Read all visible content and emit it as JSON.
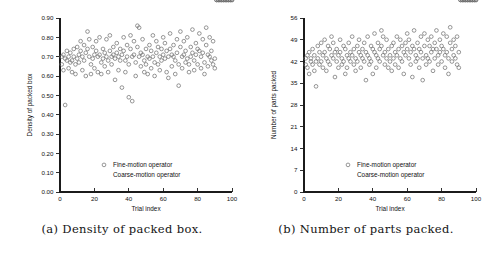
{
  "figure": {
    "background": "#ffffff",
    "marker_color": "#6e6e6e",
    "axis_color": "#1b1b1b"
  },
  "subfigures": [
    {
      "id": "a",
      "caption": "(a) Density of packed box.",
      "legend": {
        "position": "inside-lower-right",
        "entries": [
          {
            "label": "Fine-motion operator",
            "marker": "open-circle"
          },
          {
            "label": "Coarse-motion operator",
            "marker": "none"
          }
        ]
      },
      "chart_data": {
        "type": "scatter",
        "title": "",
        "xlabel": "Trial index",
        "ylabel": "Density of packed box",
        "xlim": [
          0,
          100
        ],
        "ylim": [
          0.0,
          0.9
        ],
        "xticks": [
          0,
          20,
          40,
          60,
          80,
          100
        ],
        "xticklabels": [
          "0",
          "20",
          "40",
          "60",
          "80",
          "100"
        ],
        "yticks": [
          0.0,
          0.1,
          0.2,
          0.3,
          0.4,
          0.5,
          0.6,
          0.7,
          0.8,
          0.9
        ],
        "yticklabels": [
          "0.00",
          "0.10",
          "0.20",
          "0.30",
          "0.40",
          "0.50",
          "0.60",
          "0.70",
          "0.80",
          "0.90"
        ],
        "grid": false,
        "series": [
          {
            "name": "Fine-motion operator",
            "marker": "open-circle",
            "x": [
              1,
              1,
              2,
              2,
              3,
              3,
              4,
              4,
              5,
              5,
              6,
              6,
              7,
              7,
              8,
              8,
              9,
              9,
              10,
              10,
              11,
              11,
              12,
              12,
              13,
              13,
              14,
              14,
              15,
              15,
              16,
              16,
              17,
              17,
              18,
              18,
              19,
              19,
              20,
              20,
              21,
              21,
              22,
              22,
              23,
              23,
              24,
              24,
              25,
              25,
              26,
              26,
              27,
              27,
              28,
              28,
              29,
              29,
              30,
              30,
              31,
              31,
              32,
              32,
              33,
              33,
              34,
              34,
              35,
              35,
              36,
              36,
              37,
              37,
              38,
              38,
              39,
              39,
              40,
              40,
              41,
              41,
              42,
              42,
              43,
              43,
              44,
              44,
              45,
              45,
              46,
              46,
              47,
              47,
              48,
              48,
              49,
              49,
              50,
              50,
              51,
              51,
              52,
              52,
              53,
              53,
              54,
              54,
              55,
              55,
              56,
              56,
              57,
              57,
              58,
              58,
              59,
              59,
              60,
              60,
              61,
              61,
              62,
              62,
              63,
              63,
              64,
              64,
              65,
              65,
              66,
              66,
              67,
              67,
              68,
              68,
              69,
              69,
              70,
              70,
              71,
              71,
              72,
              72,
              73,
              73,
              74,
              74,
              75,
              75,
              76,
              76,
              77,
              77,
              78,
              78,
              79,
              79,
              80,
              80,
              81,
              81,
              82,
              82,
              83,
              83,
              84,
              84,
              85,
              85,
              86,
              86,
              87,
              87,
              88,
              88,
              89,
              89,
              90,
              90,
              91,
              91,
              92,
              92,
              93,
              93,
              94,
              94,
              95,
              95,
              96,
              96,
              97,
              97,
              98,
              98,
              99,
              99,
              100,
              100
            ],
            "y": [
              0.7,
              0.66,
              0.71,
              0.63,
              0.69,
              0.45,
              0.73,
              0.68,
              0.7,
              0.64,
              0.72,
              0.67,
              0.68,
              0.62,
              0.74,
              0.7,
              0.66,
              0.61,
              0.75,
              0.69,
              0.71,
              0.67,
              0.78,
              0.73,
              0.7,
              0.63,
              0.76,
              0.68,
              0.72,
              0.6,
              0.83,
              0.74,
              0.79,
              0.7,
              0.66,
              0.61,
              0.75,
              0.69,
              0.71,
              0.64,
              0.78,
              0.73,
              0.7,
              0.62,
              0.8,
              0.71,
              0.67,
              0.61,
              0.74,
              0.69,
              0.72,
              0.65,
              0.79,
              0.7,
              0.68,
              0.62,
              0.81,
              0.73,
              0.7,
              0.66,
              0.75,
              0.71,
              0.69,
              0.58,
              0.77,
              0.72,
              0.7,
              0.63,
              0.74,
              0.68,
              0.71,
              0.54,
              0.8,
              0.73,
              0.68,
              0.62,
              0.76,
              0.7,
              0.66,
              0.49,
              0.81,
              0.74,
              0.7,
              0.47,
              0.78,
              0.71,
              0.67,
              0.6,
              0.86,
              0.75,
              0.85,
              0.7,
              0.72,
              0.65,
              0.79,
              0.71,
              0.68,
              0.62,
              0.74,
              0.66,
              0.7,
              0.61,
              0.76,
              0.69,
              0.73,
              0.64,
              0.81,
              0.7,
              0.67,
              0.6,
              0.78,
              0.72,
              0.75,
              0.66,
              0.7,
              0.63,
              0.74,
              0.68,
              0.8,
              0.71,
              0.77,
              0.69,
              0.73,
              0.62,
              0.7,
              0.59,
              0.82,
              0.74,
              0.71,
              0.65,
              0.76,
              0.7,
              0.68,
              0.61,
              0.79,
              0.72,
              0.66,
              0.55,
              0.83,
              0.75,
              0.7,
              0.64,
              0.78,
              0.71,
              0.73,
              0.67,
              0.8,
              0.69,
              0.66,
              0.62,
              0.75,
              0.7,
              0.84,
              0.72,
              0.68,
              0.63,
              0.77,
              0.71,
              0.74,
              0.66,
              0.82,
              0.73,
              0.7,
              0.64,
              0.79,
              0.72,
              0.67,
              0.61,
              0.85,
              0.76,
              0.71,
              0.65,
              0.8,
              0.7,
              0.73,
              0.68,
              0.78,
              0.66,
              0.69,
              0.64
            ]
          }
        ]
      }
    },
    {
      "id": "b",
      "caption": "(b) Number of parts packed.",
      "legend": {
        "position": "inside-lower-right",
        "entries": [
          {
            "label": "Fine-motion operator",
            "marker": "open-circle"
          },
          {
            "label": "Coarse-motion operator",
            "marker": "none"
          }
        ]
      },
      "chart_data": {
        "type": "scatter",
        "title": "",
        "xlabel": "Trial index",
        "ylabel": "Number of parts packed",
        "xlim": [
          0,
          100
        ],
        "ylim": [
          0,
          56
        ],
        "xticks": [
          0,
          20,
          40,
          60,
          80,
          100
        ],
        "xticklabels": [
          "0",
          "20",
          "40",
          "60",
          "80",
          "100"
        ],
        "yticks": [
          0,
          7,
          14,
          21,
          28,
          35,
          42,
          49,
          56
        ],
        "yticklabels": [
          "0",
          "7",
          "14",
          "21",
          "28",
          "35",
          "42",
          "49",
          "56"
        ],
        "grid": false,
        "series": [
          {
            "name": "Fine-motion operator",
            "marker": "open-circle",
            "x": [
              1,
              1,
              2,
              2,
              3,
              3,
              4,
              4,
              5,
              5,
              6,
              6,
              7,
              7,
              8,
              8,
              9,
              9,
              10,
              10,
              11,
              11,
              12,
              12,
              13,
              13,
              14,
              14,
              15,
              15,
              16,
              16,
              17,
              17,
              18,
              18,
              19,
              19,
              20,
              20,
              21,
              21,
              22,
              22,
              23,
              23,
              24,
              24,
              25,
              25,
              26,
              26,
              27,
              27,
              28,
              28,
              29,
              29,
              30,
              30,
              31,
              31,
              32,
              32,
              33,
              33,
              34,
              34,
              35,
              35,
              36,
              36,
              37,
              37,
              38,
              38,
              39,
              39,
              40,
              40,
              41,
              41,
              42,
              42,
              43,
              43,
              44,
              44,
              45,
              45,
              46,
              46,
              47,
              47,
              48,
              48,
              49,
              49,
              50,
              50,
              51,
              51,
              52,
              52,
              53,
              53,
              54,
              54,
              55,
              55,
              56,
              56,
              57,
              57,
              58,
              58,
              59,
              59,
              60,
              60,
              61,
              61,
              62,
              62,
              63,
              63,
              64,
              64,
              65,
              65,
              66,
              66,
              67,
              67,
              68,
              68,
              69,
              69,
              70,
              70,
              71,
              71,
              72,
              72,
              73,
              73,
              74,
              74,
              75,
              75,
              76,
              76,
              77,
              77,
              78,
              78,
              79,
              79,
              80,
              80,
              81,
              81,
              82,
              82,
              83,
              83,
              84,
              84,
              85,
              85,
              86,
              86,
              87,
              87,
              88,
              88,
              89,
              89,
              90,
              90,
              91,
              91,
              92,
              92,
              93,
              93,
              94,
              94,
              95,
              95,
              96,
              96,
              97,
              97,
              98,
              98,
              99,
              99,
              100,
              100
            ],
            "y": [
              43,
              41,
              44,
              40,
              45,
              38,
              43,
              42,
              46,
              41,
              44,
              39,
              42,
              34,
              47,
              43,
              45,
              41,
              48,
              42,
              44,
              40,
              49,
              45,
              43,
              39,
              47,
              42,
              46,
              41,
              50,
              44,
              48,
              43,
              45,
              37,
              46,
              42,
              44,
              40,
              49,
              45,
              43,
              41,
              47,
              42,
              46,
              38,
              44,
              40,
              48,
              43,
              45,
              42,
              50,
              44,
              46,
              41,
              43,
              39,
              47,
              42,
              49,
              45,
              44,
              40,
              46,
              43,
              48,
              42,
              45,
              36,
              50,
              44,
              43,
              41,
              47,
              42,
              46,
              38,
              51,
              45,
              44,
              40,
              48,
              43,
              46,
              42,
              52,
              47,
              50,
              44,
              45,
              41,
              49,
              43,
              46,
              40,
              44,
              42,
              47,
              39,
              48,
              43,
              45,
              41,
              50,
              44,
              46,
              40,
              49,
              43,
              47,
              42,
              45,
              38,
              48,
              44,
              51,
              46,
              49,
              43,
              45,
              41,
              47,
              37,
              52,
              46,
              44,
              42,
              48,
              43,
              46,
              40,
              50,
              45,
              43,
              36,
              51,
              47,
              44,
              41,
              49,
              43,
              47,
              42,
              50,
              45,
              46,
              39,
              48,
              43,
              52,
              46,
              44,
              41,
              49,
              45,
              47,
              42,
              51,
              46,
              44,
              40,
              50,
              45,
              43,
              38,
              53,
              48,
              46,
              42,
              49,
              44,
              47,
              43,
              50,
              41,
              45,
              40
            ]
          }
        ]
      }
    }
  ]
}
